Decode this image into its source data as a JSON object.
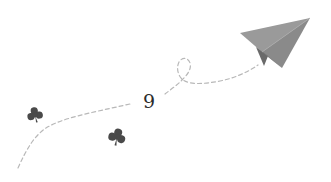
{
  "illustration": {
    "number": "9",
    "icons": {
      "plane": "paper-plane-icon",
      "clover_left": "clover-icon",
      "clover_right": "clover-icon"
    },
    "colors": {
      "background": "#ffffff",
      "plane_main": "#8c8c8c",
      "plane_fold": "#6e6e6e",
      "plane_shadow": "#5a5a5a",
      "path_dash": "#b8b8b8",
      "clover": "#4a4a4a",
      "number": "#2b2b2b"
    }
  }
}
